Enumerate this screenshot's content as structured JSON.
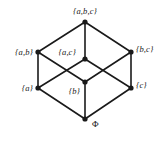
{
  "figure": {
    "stroke_color": "#1a1a1a",
    "node_color": "#1a1a1a",
    "background_color": "#ffffff"
  },
  "nodes": [
    {
      "id": "abc",
      "label": "{a,b,c}",
      "x": 85,
      "y": 22,
      "label_x": 85,
      "label_y": 11,
      "anchor": "anchor-mid",
      "italic": true
    },
    {
      "id": "ab",
      "label": "{a,b}",
      "x": 38,
      "y": 52,
      "label_x": 33,
      "label_y": 52,
      "anchor": "anchor-right",
      "italic": true
    },
    {
      "id": "ac",
      "label": "{a,c}",
      "x": 85,
      "y": 59,
      "label_x": 76,
      "label_y": 52,
      "anchor": "anchor-right",
      "italic": true
    },
    {
      "id": "bc",
      "label": "{b,c}",
      "x": 131,
      "y": 52,
      "label_x": 136,
      "label_y": 49,
      "anchor": "anchor-left",
      "italic": true
    },
    {
      "id": "a",
      "label": "{a}",
      "x": 38,
      "y": 88,
      "label_x": 33,
      "label_y": 88,
      "anchor": "anchor-right",
      "italic": true
    },
    {
      "id": "b",
      "label": "{b}",
      "x": 85,
      "y": 82,
      "label_x": 80,
      "label_y": 91,
      "anchor": "anchor-right",
      "italic": true
    },
    {
      "id": "c",
      "label": "{c}",
      "x": 131,
      "y": 88,
      "label_x": 136,
      "label_y": 85,
      "anchor": "anchor-left",
      "italic": true
    },
    {
      "id": "empty",
      "label": "Φ",
      "x": 85,
      "y": 119,
      "label_x": 92,
      "label_y": 124,
      "anchor": "anchor-left",
      "italic": false
    }
  ],
  "edges": [
    {
      "from": "abc",
      "to": "ab"
    },
    {
      "from": "abc",
      "to": "bc"
    },
    {
      "from": "abc",
      "to": "ac"
    },
    {
      "from": "ab",
      "to": "a"
    },
    {
      "from": "ab",
      "to": "b"
    },
    {
      "from": "bc",
      "to": "b"
    },
    {
      "from": "bc",
      "to": "c"
    },
    {
      "from": "ac",
      "to": "a"
    },
    {
      "from": "ac",
      "to": "c"
    },
    {
      "from": "a",
      "to": "empty"
    },
    {
      "from": "b",
      "to": "empty"
    },
    {
      "from": "c",
      "to": "empty"
    }
  ]
}
